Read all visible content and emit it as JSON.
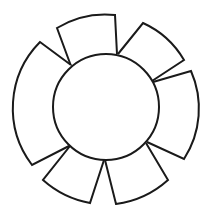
{
  "diagram": {
    "type": "circle-with-petals",
    "stroke_color": "#1a1a1a",
    "fill_color": "#ffffff",
    "background": "#ffffff",
    "center_circle": {
      "cx": 106,
      "cy": 107,
      "r": 53
    },
    "petals": [
      {
        "name": "top",
        "inner": [
          [
            71,
            66
          ],
          [
            117,
            54
          ]
        ],
        "outer": [
          [
            57,
            28
          ],
          [
            115,
            15
          ]
        ],
        "outer_radius": 93,
        "path": "M71,66 L57,28 A93,93 0 0,1 115,15 L117,54"
      },
      {
        "name": "upper-right",
        "inner": [
          [
            118,
            54
          ],
          [
            152,
            81
          ]
        ],
        "outer": [
          [
            143,
            23
          ],
          [
            184,
            60
          ]
        ],
        "outer_radius": 91,
        "path": "M118,54 L143,23 A91,91 0 0,1 184,60 L152,81"
      },
      {
        "name": "right",
        "inner": [
          [
            153,
            82
          ],
          [
            147,
            142
          ]
        ],
        "outer": [
          [
            191,
            71
          ],
          [
            184,
            159
          ]
        ],
        "outer_radius": 93,
        "path": "M153,82 L191,71 A93,93 0 0,1 184,159 L147,142"
      },
      {
        "name": "lower-right",
        "inner": [
          [
            146,
            143
          ],
          [
            105,
            160
          ]
        ],
        "outer": [
          [
            168,
            180
          ],
          [
            116,
            204
          ]
        ],
        "outer_radius": 97,
        "path": "M146,143 L168,180 A97,97 0 0,1 116,204 L105,160"
      },
      {
        "name": "lower-left",
        "inner": [
          [
            104,
            160
          ],
          [
            70,
            146
          ]
        ],
        "outer": [
          [
            90,
            203
          ],
          [
            43,
            180
          ]
        ],
        "outer_radius": 97,
        "path": "M104,160 L90,203 A97,97 0 0,1 43,180 L70,146"
      },
      {
        "name": "left",
        "inner": [
          [
            69,
            146
          ],
          [
            71,
            65
          ]
        ],
        "outer": [
          [
            32,
            165
          ],
          [
            40,
            42
          ]
        ],
        "outer_radius": 94,
        "path": "M69,146 L32,165 A94,94 0 0,1 40,42 L71,65"
      }
    ]
  }
}
